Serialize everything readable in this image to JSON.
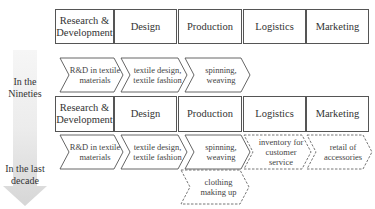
{
  "diagram": {
    "type": "value-chain-evolution",
    "time_arrow": {
      "direction": "down",
      "gradient_top": "#f4f4f4",
      "gradient_bottom": "#d8d8d8"
    },
    "periods": [
      {
        "label": "In the\nNineties",
        "label_line1": "In the",
        "label_line2": "Nineties",
        "stages": [
          {
            "label": "Research &\nDevelopment",
            "line1": "Research &",
            "line2": "Development"
          },
          {
            "label": "Design",
            "line1": "Design",
            "line2": ""
          },
          {
            "label": "Production",
            "line1": "Production",
            "line2": ""
          },
          {
            "label": "Logistics",
            "line1": "Logistics",
            "line2": ""
          },
          {
            "label": "Marketing",
            "line1": "Marketing",
            "line2": ""
          }
        ],
        "activities": [
          {
            "stage": "Research & Development",
            "line1": "R&D in textile",
            "line2": "materials",
            "line3": "",
            "style": "solid"
          },
          {
            "stage": "Design",
            "line1": "textile design,",
            "line2": "textile fashion",
            "line3": "",
            "style": "solid"
          },
          {
            "stage": "Production",
            "line1": "spinning,",
            "line2": "weaving",
            "line3": "",
            "style": "solid"
          }
        ]
      },
      {
        "label": "In the last\ndecade",
        "label_line1": "In the last",
        "label_line2": "decade",
        "stages": [
          {
            "label": "Research &\nDevelopment",
            "line1": "Research &",
            "line2": "Development"
          },
          {
            "label": "Design",
            "line1": "Design",
            "line2": ""
          },
          {
            "label": "Production",
            "line1": "Production",
            "line2": ""
          },
          {
            "label": "Logistics",
            "line1": "Logistics",
            "line2": ""
          },
          {
            "label": "Marketing",
            "line1": "Marketing",
            "line2": ""
          }
        ],
        "activities": [
          {
            "stage": "Research & Development",
            "line1": "R&D in textile",
            "line2": "materials",
            "line3": "",
            "style": "solid"
          },
          {
            "stage": "Design",
            "line1": "textile design,",
            "line2": "textile fashion",
            "line3": "",
            "style": "solid"
          },
          {
            "stage": "Production",
            "line1": "spinning,",
            "line2": "weaving",
            "line3": "",
            "style": "solid"
          },
          {
            "stage": "Logistics",
            "line1": "inventory for",
            "line2": "customer",
            "line3": "service",
            "style": "dashed"
          },
          {
            "stage": "Marketing",
            "line1": "retail of",
            "line2": "accessories",
            "line3": "",
            "style": "dashed"
          },
          {
            "stage": "Production",
            "line1": "clothing",
            "line2": "making up",
            "line3": "",
            "style": "dashed"
          }
        ]
      }
    ],
    "colors": {
      "box_border": "#555555",
      "solid_chevron_stroke": "#555555",
      "dashed_chevron_stroke": "#666666",
      "text": "#333333"
    }
  }
}
